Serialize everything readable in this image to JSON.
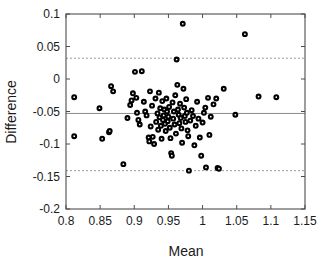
{
  "chart_data": {
    "type": "scatter",
    "title": "",
    "subtitle": "",
    "xlabel": "Mean",
    "ylabel": "Difference",
    "xlim": [
      0.8,
      1.15
    ],
    "ylim": [
      -0.2,
      0.1
    ],
    "grid": false,
    "legend": null,
    "legend_position": "none",
    "xticks": [
      "0.8",
      "0.85",
      "0.9",
      "0.95",
      "1",
      "1.05",
      "1.1",
      "1.15"
    ],
    "xtick_values": [
      0.8,
      0.85,
      0.9,
      0.95,
      1.0,
      1.05,
      1.1,
      1.15
    ],
    "yticks": [
      "0.1",
      "0.05",
      "0",
      "-0.05",
      "-0.1",
      "-0.15",
      "-0.2"
    ],
    "ytick_values": [
      0.1,
      0.05,
      0.0,
      -0.05,
      -0.1,
      -0.15,
      -0.2
    ],
    "marker_style": "open-circle",
    "marker_color": "#000000",
    "marker_fill": "#ffffff",
    "reference_lines": [
      {
        "name": "mean-difference",
        "orientation": "horizontal",
        "value": -0.053,
        "style": "solid",
        "color": "#8c8c8c"
      },
      {
        "name": "upper-limit-of-agreement",
        "orientation": "horizontal",
        "value": 0.032,
        "style": "dashed",
        "color": "#9a9a9a"
      },
      {
        "name": "lower-limit-of-agreement",
        "orientation": "horizontal",
        "value": -0.141,
        "style": "dashed",
        "color": "#9a9a9a"
      }
    ],
    "n_points": 101,
    "points": [
      [
        0.812,
        -0.028
      ],
      [
        0.812,
        -0.088
      ],
      [
        0.849,
        -0.045
      ],
      [
        0.853,
        -0.092
      ],
      [
        0.863,
        -0.082
      ],
      [
        0.864,
        -0.08
      ],
      [
        0.866,
        -0.011
      ],
      [
        0.869,
        -0.019
      ],
      [
        0.884,
        -0.131
      ],
      [
        0.89,
        -0.06
      ],
      [
        0.894,
        -0.04
      ],
      [
        0.896,
        -0.033
      ],
      [
        0.898,
        -0.022
      ],
      [
        0.901,
        0.011
      ],
      [
        0.903,
        -0.029
      ],
      [
        0.904,
        -0.052
      ],
      [
        0.906,
        -0.063
      ],
      [
        0.908,
        -0.07
      ],
      [
        0.911,
        0.012
      ],
      [
        0.914,
        -0.035
      ],
      [
        0.916,
        -0.05
      ],
      [
        0.918,
        -0.056
      ],
      [
        0.921,
        -0.09
      ],
      [
        0.922,
        -0.096
      ],
      [
        0.923,
        -0.019
      ],
      [
        0.924,
        -0.073
      ],
      [
        0.926,
        -0.041
      ],
      [
        0.927,
        -0.089
      ],
      [
        0.929,
        -0.1
      ],
      [
        0.931,
        -0.03
      ],
      [
        0.932,
        -0.066
      ],
      [
        0.934,
        -0.053
      ],
      [
        0.935,
        -0.078
      ],
      [
        0.936,
        -0.021
      ],
      [
        0.937,
        -0.059
      ],
      [
        0.938,
        -0.045
      ],
      [
        0.939,
        -0.072
      ],
      [
        0.94,
        -0.092
      ],
      [
        0.941,
        -0.034
      ],
      [
        0.942,
        -0.063
      ],
      [
        0.943,
        -0.056
      ],
      [
        0.944,
        -0.047
      ],
      [
        0.945,
        -0.069
      ],
      [
        0.946,
        -0.08
      ],
      [
        0.947,
        -0.03
      ],
      [
        0.948,
        -0.05
      ],
      [
        0.949,
        -0.065
      ],
      [
        0.95,
        -0.058
      ],
      [
        0.951,
        -0.043
      ],
      [
        0.952,
        -0.075
      ],
      [
        0.953,
        -0.091
      ],
      [
        0.954,
        -0.114
      ],
      [
        0.955,
        -0.118
      ],
      [
        0.956,
        -0.036
      ],
      [
        0.957,
        -0.061
      ],
      [
        0.958,
        -0.05
      ],
      [
        0.959,
        -0.07
      ],
      [
        0.96,
        -0.025
      ],
      [
        0.961,
        -0.084
      ],
      [
        0.962,
        0.03
      ],
      [
        0.963,
        -0.009
      ],
      [
        0.964,
        -0.047
      ],
      [
        0.965,
        -0.055
      ],
      [
        0.966,
        -0.068
      ],
      [
        0.967,
        -0.038
      ],
      [
        0.968,
        -0.06
      ],
      [
        0.969,
        -0.076
      ],
      [
        0.97,
        -0.098
      ],
      [
        0.971,
        0.085
      ],
      [
        0.972,
        -0.015
      ],
      [
        0.973,
        -0.044
      ],
      [
        0.974,
        -0.057
      ],
      [
        0.975,
        -0.066
      ],
      [
        0.976,
        -0.031
      ],
      [
        0.977,
        -0.052
      ],
      [
        0.978,
        -0.079
      ],
      [
        0.979,
        -0.088
      ],
      [
        0.98,
        -0.141
      ],
      [
        0.982,
        -0.064
      ],
      [
        0.984,
        -0.048
      ],
      [
        0.986,
        -0.057
      ],
      [
        0.988,
        -0.102
      ],
      [
        0.99,
        -0.072
      ],
      [
        0.992,
        -0.035
      ],
      [
        0.994,
        -0.061
      ],
      [
        0.996,
        -0.09
      ],
      [
        0.998,
        -0.118
      ],
      [
        1.0,
        -0.067
      ],
      [
        1.002,
        -0.052
      ],
      [
        1.004,
        -0.044
      ],
      [
        1.005,
        -0.136
      ],
      [
        1.008,
        -0.029
      ],
      [
        1.01,
        -0.086
      ],
      [
        1.012,
        -0.058
      ],
      [
        1.016,
        -0.039
      ],
      [
        1.02,
        -0.03
      ],
      [
        1.022,
        -0.137
      ],
      [
        1.024,
        -0.138
      ],
      [
        1.031,
        -0.015
      ],
      [
        1.048,
        -0.055
      ],
      [
        1.062,
        0.069
      ],
      [
        1.082,
        -0.027
      ],
      [
        1.108,
        -0.028
      ]
    ]
  },
  "axes": {
    "x_axis_name": "mean-axis",
    "y_axis_name": "difference-axis"
  }
}
